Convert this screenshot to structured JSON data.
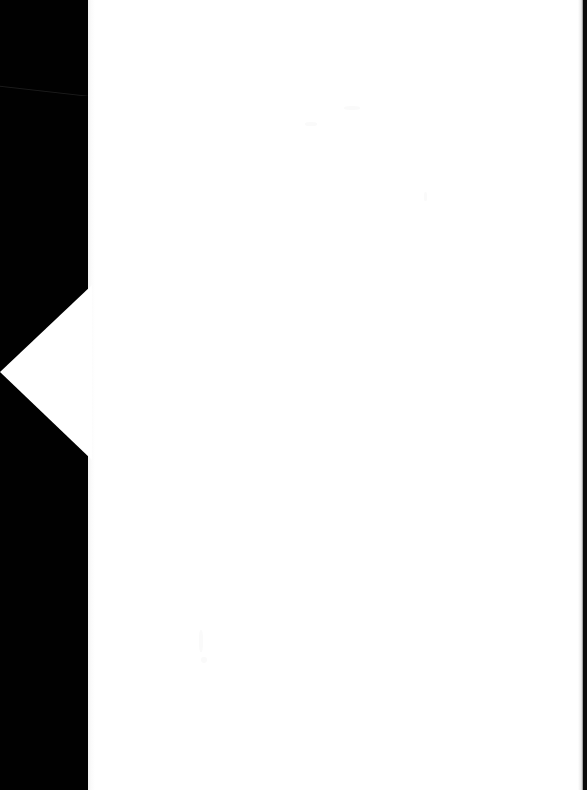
{
  "document": {
    "kind": "scanned-page-image",
    "page_content_text": "",
    "page_state_label": "Blank page",
    "width_px": 587,
    "height_px": 790
  },
  "colors": {
    "scanner_backdrop": "#010101",
    "page_white": "#ffffff",
    "page_seam": "#f2f2f2",
    "right_edge_strip": "#0a0a0a",
    "scan_streak": "#1b1b1b",
    "faint_mark": "#fafafa"
  },
  "regions": {
    "backdrop_left": {
      "name": "scanner-backdrop-left",
      "x": 0,
      "y": 0,
      "width": 92,
      "height": 790
    },
    "page_sheet": {
      "name": "page-sheet",
      "x": 88,
      "y": 0,
      "width": 497,
      "height": 790
    },
    "corner_wedge": {
      "name": "page-corner-wedge",
      "description": "left-pointing white triangle",
      "apex": {
        "x": 0,
        "y": 372
      },
      "top_vertex": {
        "x": 92,
        "y": 285
      },
      "bottom_vertex": {
        "x": 92,
        "y": 460
      }
    },
    "backdrop_right": {
      "name": "scanner-backdrop-right",
      "x": 583,
      "y": 0,
      "width": 4,
      "height": 790
    },
    "scan_streak": {
      "name": "scan-streak-artifact",
      "x1": 0,
      "y1": 82,
      "x2": 88,
      "y2": 93
    }
  },
  "artifacts": {
    "faint_marks": [
      {
        "x": 199,
        "y": 630,
        "width": 4,
        "height": 22
      },
      {
        "x": 201,
        "y": 657,
        "width": 6,
        "height": 6
      },
      {
        "x": 344,
        "y": 106,
        "width": 16,
        "height": 4
      },
      {
        "x": 305,
        "y": 122,
        "width": 12,
        "height": 4
      },
      {
        "x": 424,
        "y": 192,
        "width": 3,
        "height": 9
      }
    ]
  }
}
